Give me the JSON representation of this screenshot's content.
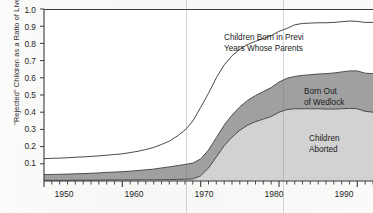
{
  "chart_data": {
    "type": "area",
    "stacked": true,
    "title": "",
    "xlabel": "",
    "ylabel": "\"Rejected\" Children as a Ratio of Live Births",
    "xlim": [
      1950,
      1992
    ],
    "ylim": [
      0,
      1.0
    ],
    "grid": false,
    "legend_position": "inline-annotations",
    "y_ticks": [
      "1.0",
      "0.9",
      "0.8",
      "0.7",
      "0.6",
      "0.5",
      "0.4",
      "0.3",
      "0.2",
      "0.1"
    ],
    "y_tick_values": [
      1.0,
      0.9,
      0.8,
      0.7,
      0.6,
      0.5,
      0.4,
      0.3,
      0.2,
      0.1
    ],
    "x_ticks": [
      "1950",
      "1960",
      "1970",
      "1980",
      "1990"
    ],
    "x_tick_values": [
      1950,
      1960,
      1970,
      1980,
      1990
    ],
    "x_minor_tick_interval": 1,
    "x": [
      1950,
      1951,
      1952,
      1953,
      1954,
      1955,
      1956,
      1957,
      1958,
      1959,
      1960,
      1961,
      1962,
      1963,
      1964,
      1965,
      1966,
      1967,
      1968,
      1969,
      1970,
      1971,
      1972,
      1973,
      1974,
      1975,
      1976,
      1977,
      1978,
      1979,
      1980,
      1981,
      1982,
      1983,
      1984,
      1985,
      1986,
      1987,
      1988,
      1989,
      1990,
      1991,
      1992
    ],
    "series": [
      {
        "name": "Children Aborted",
        "label": "Children Aborted",
        "color": "#d2d2d2",
        "values": [
          0.004,
          0.004,
          0.004,
          0.004,
          0.005,
          0.005,
          0.005,
          0.005,
          0.006,
          0.006,
          0.006,
          0.006,
          0.007,
          0.007,
          0.007,
          0.008,
          0.008,
          0.009,
          0.01,
          0.012,
          0.03,
          0.075,
          0.14,
          0.205,
          0.255,
          0.295,
          0.325,
          0.345,
          0.36,
          0.375,
          0.4,
          0.415,
          0.42,
          0.42,
          0.42,
          0.42,
          0.418,
          0.418,
          0.42,
          0.422,
          0.42,
          0.405,
          0.4
        ]
      },
      {
        "name": "Born Out of Wedlock",
        "label": "Born Out of Wedlock",
        "color": "#a0a0a0",
        "values": [
          0.033,
          0.034,
          0.035,
          0.036,
          0.037,
          0.038,
          0.04,
          0.042,
          0.044,
          0.046,
          0.048,
          0.051,
          0.054,
          0.058,
          0.062,
          0.068,
          0.074,
          0.08,
          0.086,
          0.092,
          0.098,
          0.105,
          0.112,
          0.12,
          0.128,
          0.136,
          0.144,
          0.152,
          0.16,
          0.168,
          0.175,
          0.182,
          0.188,
          0.194,
          0.198,
          0.202,
          0.206,
          0.21,
          0.214,
          0.218,
          0.22,
          0.222,
          0.224
        ]
      },
      {
        "name": "Children Born in Previous Years Whose Parents",
        "label": "Children Born in Previ",
        "label_line2": "Years Whose Parents",
        "label_clipped": true,
        "color": "#ffffff",
        "values": [
          0.093,
          0.094,
          0.094,
          0.095,
          0.096,
          0.097,
          0.098,
          0.099,
          0.1,
          0.102,
          0.104,
          0.108,
          0.112,
          0.118,
          0.126,
          0.136,
          0.15,
          0.172,
          0.2,
          0.245,
          0.3,
          0.33,
          0.348,
          0.35,
          0.345,
          0.335,
          0.325,
          0.315,
          0.308,
          0.302,
          0.295,
          0.29,
          0.3,
          0.302,
          0.3,
          0.298,
          0.296,
          0.294,
          0.292,
          0.29,
          0.288,
          0.295,
          0.298
        ]
      }
    ],
    "total_curve_note": "Top outline = sum of the three stacked bands",
    "annotations": [
      {
        "name": "top-band-label",
        "text_line1": "Children Born in Previ",
        "text_line2": "Years Whose Parents"
      },
      {
        "name": "middle-band-label",
        "text_line1": "Born Out",
        "text_line2": "of Wedlock"
      },
      {
        "name": "bottom-band-label",
        "text_line1": "Children",
        "text_line2": "Aborted"
      }
    ]
  },
  "axes": {
    "y_title": "\"Rejected\" Children as a Ratio of Live Births",
    "y_labels": [
      "1.0",
      "0.9",
      "0.8",
      "0.7",
      "0.6",
      "0.5",
      "0.4",
      "0.3",
      "0.2",
      "0.1"
    ],
    "x_labels": [
      "1950",
      "1960",
      "1970",
      "1980",
      "1990"
    ]
  },
  "annotations": {
    "top": {
      "line1": "Children Born in Previ",
      "line2": "Years Whose Parents"
    },
    "wedlock": {
      "line1": "Born Out",
      "line2": "of Wedlock"
    },
    "aborted": {
      "line1": "Children",
      "line2": "Aborted"
    }
  },
  "colors": {
    "aborted_band": "#d2d2d2",
    "wedlock_band": "#a0a0a0",
    "top_band": "#ffffff",
    "axis": "#3a3a3a",
    "text": "#1f1f1f"
  }
}
